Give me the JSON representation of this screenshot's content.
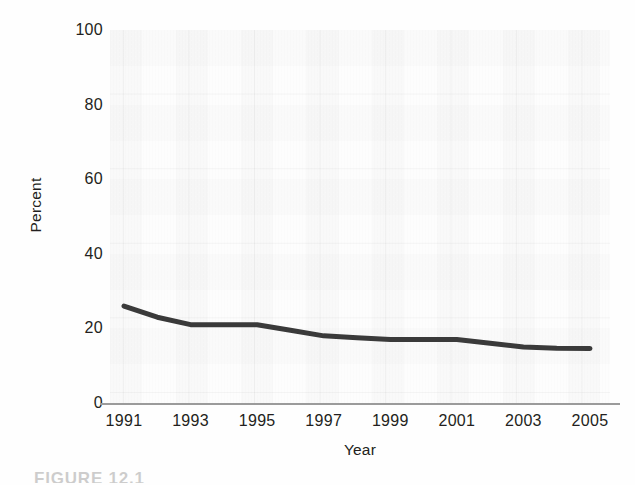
{
  "figure": {
    "caption_fragment": "FIGURE 12.1"
  },
  "chart_data": {
    "type": "line",
    "title": "",
    "xlabel": "Year",
    "ylabel": "Percent",
    "xlim": [
      1991,
      2005
    ],
    "ylim": [
      0,
      100
    ],
    "grid": true,
    "legend": "none",
    "x_tick_labels": [
      "1991",
      "1993",
      "1995",
      "1997",
      "1999",
      "2001",
      "2003",
      "2005"
    ],
    "x_tick_values": [
      1991,
      1993,
      1995,
      1997,
      1999,
      2001,
      2003,
      2005
    ],
    "y_tick_labels": [
      "100",
      "80",
      "60",
      "40",
      "20",
      "0"
    ],
    "y_tick_values": [
      100,
      80,
      60,
      40,
      20,
      0
    ],
    "line_color": "#3a3a3a",
    "line_width_px": 5,
    "x": [
      1991,
      1992,
      1993,
      1994,
      1995,
      1996,
      1997,
      1998,
      1999,
      2000,
      2001,
      2002,
      2003,
      2004,
      2005
    ],
    "values": [
      26,
      23,
      21,
      21,
      21,
      19.5,
      18,
      17.5,
      17,
      17,
      17,
      16,
      15,
      14.7,
      14.6
    ],
    "series": [
      {
        "name": "Percent",
        "values": [
          26,
          23,
          21,
          21,
          21,
          19.5,
          18,
          17.5,
          17,
          17,
          17,
          16,
          15,
          14.7,
          14.6
        ]
      }
    ]
  }
}
